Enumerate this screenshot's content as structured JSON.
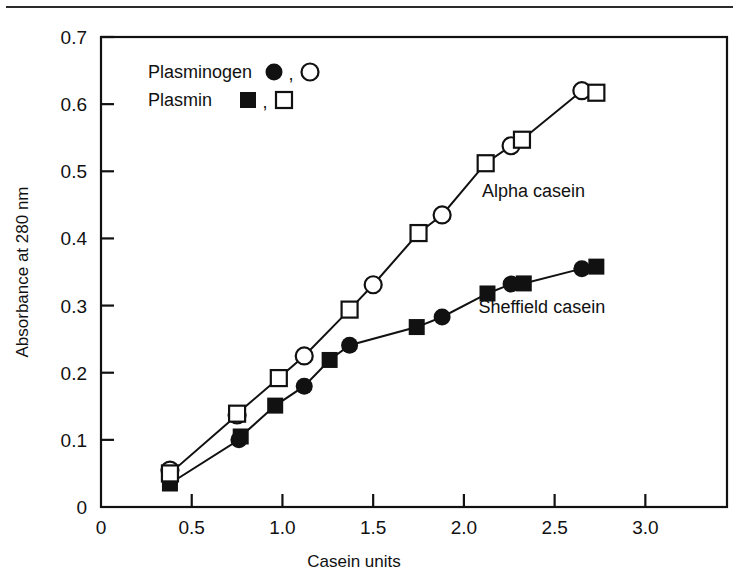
{
  "figure": {
    "background_color": "#ffffff",
    "ink_color": "#111111",
    "page_rule": true
  },
  "chart_data": {
    "type": "scatter",
    "title": "",
    "xlabel": "Casein units",
    "ylabel": "Absorbance at 280 nm",
    "xlim": [
      0,
      3.45
    ],
    "ylim": [
      0,
      0.7
    ],
    "xticks": [
      0,
      0.5,
      1.0,
      1.5,
      2.0,
      2.5,
      3.0
    ],
    "xticklabels": [
      "0",
      "0.5",
      "1.0",
      "1.5",
      "2.0",
      "2.5",
      "3.0"
    ],
    "yticks": [
      0,
      0.1,
      0.2,
      0.3,
      0.4,
      0.5,
      0.6,
      0.7
    ],
    "yticklabels": [
      "0",
      "0.1",
      "0.2",
      "0.3",
      "0.4",
      "0.5",
      "0.6",
      "0.7"
    ],
    "grid": false,
    "frame": "box",
    "legend_position": "upper-left-inside",
    "series": [
      {
        "name": "Plasminogen",
        "marker": "filled-circle",
        "group": "Sheffield casein",
        "points": [
          {
            "x": 0.38,
            "y": 0.04
          },
          {
            "x": 0.76,
            "y": 0.1
          },
          {
            "x": 1.12,
            "y": 0.18
          },
          {
            "x": 1.37,
            "y": 0.241
          },
          {
            "x": 1.88,
            "y": 0.283
          },
          {
            "x": 2.26,
            "y": 0.332
          },
          {
            "x": 2.65,
            "y": 0.355
          }
        ]
      },
      {
        "name": "Plasmin",
        "marker": "filled-square",
        "group": "Sheffield casein",
        "points": [
          {
            "x": 0.38,
            "y": 0.035
          },
          {
            "x": 0.77,
            "y": 0.105
          },
          {
            "x": 0.96,
            "y": 0.151
          },
          {
            "x": 1.26,
            "y": 0.219
          },
          {
            "x": 1.74,
            "y": 0.268
          },
          {
            "x": 2.13,
            "y": 0.318
          },
          {
            "x": 2.33,
            "y": 0.333
          },
          {
            "x": 2.73,
            "y": 0.358
          }
        ]
      },
      {
        "name": "Plasminogen",
        "marker": "open-circle",
        "group": "Alpha casein",
        "points": [
          {
            "x": 0.38,
            "y": 0.055
          },
          {
            "x": 0.75,
            "y": 0.137
          },
          {
            "x": 1.12,
            "y": 0.225
          },
          {
            "x": 1.5,
            "y": 0.331
          },
          {
            "x": 1.88,
            "y": 0.435
          },
          {
            "x": 2.26,
            "y": 0.538
          },
          {
            "x": 2.65,
            "y": 0.62
          }
        ]
      },
      {
        "name": "Plasmin",
        "marker": "open-square",
        "group": "Alpha casein",
        "points": [
          {
            "x": 0.38,
            "y": 0.05
          },
          {
            "x": 0.75,
            "y": 0.139
          },
          {
            "x": 0.98,
            "y": 0.192
          },
          {
            "x": 1.37,
            "y": 0.294
          },
          {
            "x": 1.75,
            "y": 0.408
          },
          {
            "x": 2.12,
            "y": 0.512
          },
          {
            "x": 2.32,
            "y": 0.547
          },
          {
            "x": 2.73,
            "y": 0.617
          }
        ]
      }
    ],
    "annotations": [
      {
        "text": "Alpha casein",
        "x": 2.1,
        "y": 0.462
      },
      {
        "text": "Sheffield casein",
        "x": 2.08,
        "y": 0.289
      }
    ],
    "legend": [
      {
        "label": "Plasminogen",
        "markers": [
          "filled-circle",
          "open-circle"
        ],
        "separator": ","
      },
      {
        "label": "Plasmin",
        "markers": [
          "filled-square",
          "open-square"
        ],
        "separator": ","
      }
    ]
  }
}
